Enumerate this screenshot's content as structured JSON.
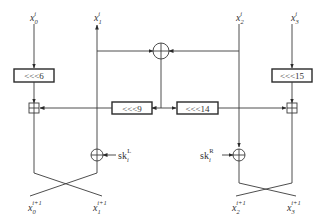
{
  "diagram": {
    "type": "block cipher round function (Feistel-like, 4 branches)",
    "inputs": [
      {
        "id": "x0",
        "base": "x",
        "sub": "0",
        "sup": "i"
      },
      {
        "id": "x1",
        "base": "x",
        "sub": "1",
        "sup": "i"
      },
      {
        "id": "x2",
        "base": "x",
        "sub": "2",
        "sup": "i"
      },
      {
        "id": "x3",
        "base": "x",
        "sub": "3",
        "sup": "i"
      }
    ],
    "outputs": [
      {
        "id": "y0",
        "base": "x",
        "sub": "0",
        "sup": "i+1"
      },
      {
        "id": "y1",
        "base": "x",
        "sub": "1",
        "sup": "i+1"
      },
      {
        "id": "y2",
        "base": "x",
        "sub": "2",
        "sup": "i+1"
      },
      {
        "id": "y3",
        "base": "x",
        "sub": "3",
        "sup": "i+1"
      }
    ],
    "rotations": {
      "r6": "<<<6",
      "r9": "<<<9",
      "r14": "<<<14",
      "r15": "<<<15"
    },
    "keys": {
      "left": {
        "base": "sk",
        "sub": "i",
        "sup": "L"
      },
      "right": {
        "base": "sk",
        "sub": "i",
        "sup": "R"
      }
    },
    "operators": {
      "xor_top": "XOR",
      "add_left": "modular addition",
      "add_right": "modular addition",
      "xor_left_key": "XOR",
      "xor_right_key": "XOR"
    }
  }
}
